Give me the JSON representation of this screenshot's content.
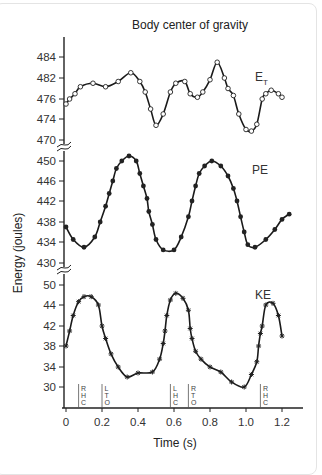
{
  "chart_data": {
    "type": "line",
    "title": "Body center of gravity",
    "xlabel": "Time (s)",
    "ylabel": "Energy (joules)",
    "xlim": [
      0,
      1.3
    ],
    "x_ticks": [
      "0",
      "0.2",
      "0.4",
      "0.6",
      "0.8",
      "1.0",
      "1.2"
    ],
    "panels": [
      {
        "name": "E_T",
        "label": "E",
        "label_subscript": "T",
        "marker": "open-circle",
        "y_ticks": [
          "484",
          "482",
          "476",
          "474",
          "470"
        ],
        "series": {
          "name": "Total energy (E_T)",
          "x": [
            0.0,
            0.02,
            0.05,
            0.08,
            0.15,
            0.22,
            0.29,
            0.36,
            0.41,
            0.44,
            0.47,
            0.5,
            0.54,
            0.58,
            0.61,
            0.66,
            0.69,
            0.73,
            0.76,
            0.8,
            0.84,
            0.88,
            0.9,
            0.93,
            0.96,
            1.0,
            1.03,
            1.06,
            1.09,
            1.11,
            1.14,
            1.18,
            1.2
          ],
          "y": [
            475.5,
            476,
            477.5,
            479.5,
            480.5,
            479.5,
            481,
            482.5,
            481,
            478,
            475,
            472.8,
            474.5,
            478,
            480.5,
            481,
            477.5,
            476.5,
            478,
            481.5,
            483.5,
            482,
            479,
            477,
            474.5,
            472,
            471.7,
            473,
            476,
            477.5,
            478.5,
            477.5,
            476.5
          ]
        },
        "value_range": [
          471.5,
          483.5
        ]
      },
      {
        "name": "PE",
        "label": "PE",
        "marker": "filled-circle",
        "y_ticks": [
          "450",
          "446",
          "442",
          "438",
          "434",
          "430"
        ],
        "series": {
          "name": "Potential energy (PE)",
          "x": [
            0.0,
            0.04,
            0.1,
            0.16,
            0.19,
            0.22,
            0.24,
            0.26,
            0.28,
            0.31,
            0.35,
            0.39,
            0.41,
            0.43,
            0.45,
            0.46,
            0.48,
            0.5,
            0.54,
            0.6,
            0.64,
            0.68,
            0.7,
            0.72,
            0.74,
            0.77,
            0.81,
            0.86,
            0.9,
            0.93,
            0.95,
            0.97,
            0.99,
            1.01,
            1.05,
            1.11,
            1.16,
            1.2,
            1.24
          ],
          "y": [
            437,
            434.5,
            433,
            435,
            438,
            441,
            443.5,
            446,
            448.5,
            450,
            451,
            450,
            447.5,
            445,
            442.5,
            440,
            437.5,
            434.5,
            432.5,
            432.5,
            435,
            439,
            442,
            445,
            447.5,
            449,
            450,
            449,
            447,
            444.5,
            442,
            439,
            436,
            433.5,
            433,
            434.5,
            436.5,
            438.5,
            439.5
          ]
        },
        "value_range": [
          432,
          451
        ]
      },
      {
        "name": "KE",
        "label": "KE",
        "marker": "star",
        "y_ticks": [
          "50",
          "44",
          "42",
          "38",
          "34",
          "30"
        ],
        "series": {
          "name": "Kinetic energy (KE)",
          "x": [
            0.0,
            0.02,
            0.04,
            0.07,
            0.1,
            0.14,
            0.18,
            0.2,
            0.22,
            0.25,
            0.29,
            0.34,
            0.4,
            0.48,
            0.52,
            0.54,
            0.55,
            0.56,
            0.58,
            0.61,
            0.65,
            0.68,
            0.69,
            0.7,
            0.72,
            0.75,
            0.8,
            0.86,
            0.92,
            0.99,
            1.03,
            1.06,
            1.07,
            1.08,
            1.09,
            1.11,
            1.15,
            1.18,
            1.2
          ],
          "y": [
            38,
            41,
            43,
            45,
            46.5,
            46.5,
            44,
            42,
            39.5,
            36.5,
            34,
            32,
            32.8,
            33,
            35.5,
            38.5,
            41,
            43,
            45.5,
            47.5,
            46,
            43.5,
            41.5,
            39.5,
            37,
            35.5,
            34,
            33,
            31,
            30,
            32.5,
            35,
            38,
            40.5,
            42,
            44,
            44.5,
            43,
            40
          ]
        },
        "value_range": [
          29.8,
          47.8
        ]
      }
    ],
    "gait_events": [
      {
        "time": 0.07,
        "label": [
          "R",
          "H",
          "C"
        ]
      },
      {
        "time": 0.2,
        "label": [
          "L",
          "T",
          "O"
        ]
      },
      {
        "time": 0.58,
        "label": [
          "L",
          "H",
          "C"
        ]
      },
      {
        "time": 0.68,
        "label": [
          "R",
          "T",
          "O"
        ]
      },
      {
        "time": 1.08,
        "label": [
          "R",
          "H",
          "C"
        ]
      }
    ],
    "axis_breaks": [
      "between 470 and 450",
      "between 430 and 50"
    ],
    "grid": false,
    "legend": "inline labels at right of each panel"
  }
}
